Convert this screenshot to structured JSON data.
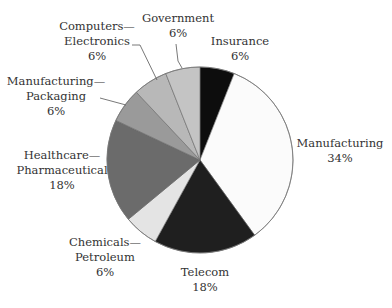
{
  "chart_data": {
    "type": "pie",
    "title": "",
    "start_angle_deg": 0,
    "direction": "clockwise",
    "center": [
      200,
      160
    ],
    "radius": 93,
    "slices": [
      {
        "name": "Insurance",
        "line1": "Insurance",
        "line2": "",
        "value": 6,
        "label": "6%",
        "color": "#0d0d0d"
      },
      {
        "name": "Manufacturing",
        "line1": "Manufacturing",
        "line2": "",
        "value": 34,
        "label": "34%",
        "color": "#fbfbfb"
      },
      {
        "name": "Telecom",
        "line1": "Telecom",
        "line2": "",
        "value": 18,
        "label": "18%",
        "color": "#1f1f1f"
      },
      {
        "name": "Chemicals—Petroleum",
        "line1": "Chemicals—",
        "line2": "Petroleum",
        "value": 6,
        "label": "6%",
        "color": "#e4e4e4"
      },
      {
        "name": "Healthcare—Pharmaceutical",
        "line1": "Healthcare—",
        "line2": "Pharmaceutical",
        "value": 18,
        "label": "18%",
        "color": "#6b6b6b"
      },
      {
        "name": "Manufacturing—Packaging",
        "line1": "Manufacturing—",
        "line2": "Packaging",
        "value": 6,
        "label": "6%",
        "color": "#9a9a9a"
      },
      {
        "name": "Computers—Electronics",
        "line1": "Computers—",
        "line2": "Electronics",
        "value": 6,
        "label": "6%",
        "color": "#b8b8b8"
      },
      {
        "name": "Government",
        "line1": "Government",
        "line2": "",
        "value": 6,
        "label": "6%",
        "color": "#c4c4c4"
      }
    ],
    "legend": "none (direct labels with leader lines)"
  }
}
